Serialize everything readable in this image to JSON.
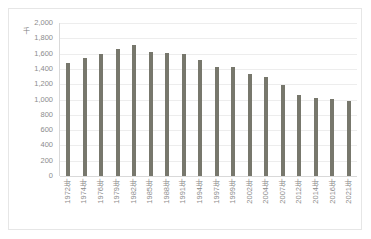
{
  "chart_data": {
    "type": "bar",
    "title": "",
    "subtitle": "",
    "xlabel": "",
    "ylabel": "",
    "unit_label": "千",
    "ylim": [
      0,
      2000
    ],
    "y_ticks": [
      "0",
      "200",
      "400",
      "600",
      "800",
      "1,000",
      "1,200",
      "1,400",
      "1,600",
      "1,800",
      "2,000"
    ],
    "y_tick_values": [
      0,
      200,
      400,
      600,
      800,
      1000,
      1200,
      1400,
      1600,
      1800,
      2000
    ],
    "grid": true,
    "legend": "none",
    "bar_color": "#77776c",
    "categories": [
      "1972年",
      "1974年",
      "1976年",
      "1979年",
      "1982年",
      "1985年",
      "1988年",
      "1991年",
      "1994年",
      "1997年",
      "1999年",
      "2002年",
      "2004年",
      "2007年",
      "2012年",
      "2014年",
      "2016年",
      "2021年"
    ],
    "values": [
      1480,
      1540,
      1600,
      1660,
      1710,
      1620,
      1605,
      1600,
      1520,
      1430,
      1420,
      1330,
      1290,
      1190,
      1060,
      1020,
      1010,
      980
    ],
    "series": [
      {
        "name": "",
        "values": [
          1480,
          1540,
          1600,
          1660,
          1710,
          1620,
          1605,
          1600,
          1520,
          1430,
          1420,
          1330,
          1290,
          1190,
          1060,
          1020,
          1010,
          980
        ]
      }
    ]
  }
}
